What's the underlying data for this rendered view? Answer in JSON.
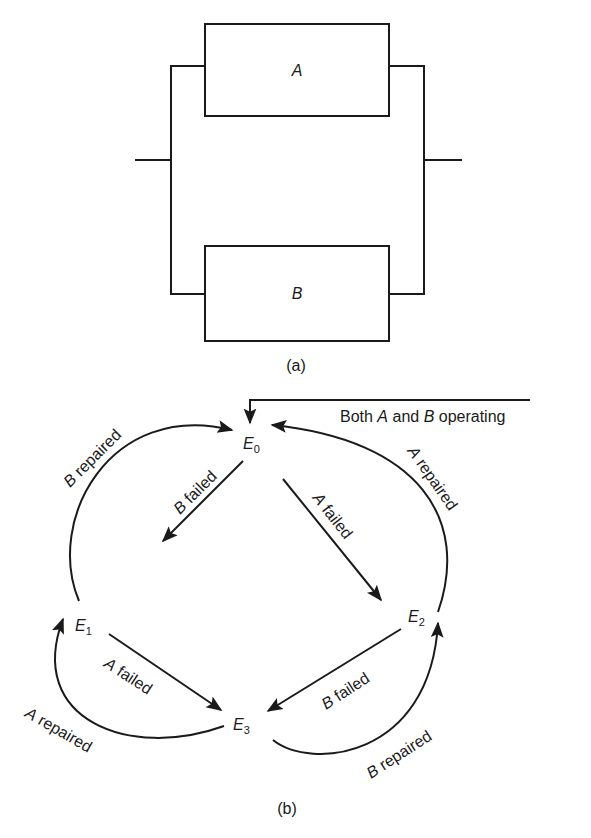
{
  "figure_a": {
    "caption": "(a)",
    "blocks": [
      {
        "id": "A",
        "label": "A"
      },
      {
        "id": "B",
        "label": "B"
      }
    ],
    "topology": "parallel"
  },
  "figure_b": {
    "caption": "(b)",
    "initial_label_pre": "Both ",
    "initial_label_a": "A",
    "initial_label_mid": " and ",
    "initial_label_b": "B",
    "initial_label_post": " operating",
    "states": [
      {
        "id": "E0",
        "main": "E",
        "sub": "0"
      },
      {
        "id": "E1",
        "main": "E",
        "sub": "1"
      },
      {
        "id": "E2",
        "main": "E",
        "sub": "2"
      },
      {
        "id": "E3",
        "main": "E",
        "sub": "3"
      }
    ],
    "transitions": [
      {
        "from": "E0",
        "to": "E1",
        "letter": "B",
        "text": " failed"
      },
      {
        "from": "E1",
        "to": "E0",
        "letter": "B",
        "text": " repaired"
      },
      {
        "from": "E0",
        "to": "E2",
        "letter": "A",
        "text": " failed"
      },
      {
        "from": "E2",
        "to": "E0",
        "letter": "A",
        "text": " repaired"
      },
      {
        "from": "E1",
        "to": "E3",
        "letter": "A",
        "text": " failed"
      },
      {
        "from": "E3",
        "to": "E1",
        "letter": "A",
        "text": " repaired"
      },
      {
        "from": "E2",
        "to": "E3",
        "letter": "B",
        "text": " failed"
      },
      {
        "from": "E3",
        "to": "E2",
        "letter": "B",
        "text": " repaired"
      }
    ]
  }
}
